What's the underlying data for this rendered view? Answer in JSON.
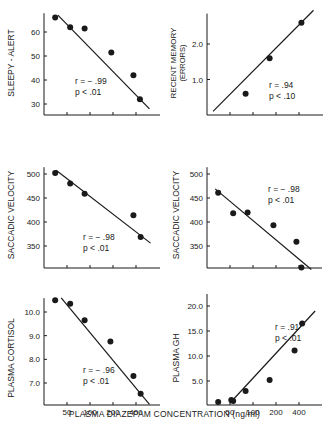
{
  "figure": {
    "shared_xlabel": "PLASMA DIAZEPAM CONCENTRATION (ng/ml)",
    "x_tick_labels": [
      "50",
      "100",
      "200",
      "400"
    ],
    "colors": {
      "ink": "#1a1a1a",
      "background": "#ffffff"
    }
  },
  "chart_data": [
    {
      "type": "scatter",
      "panel": "top-left",
      "ylabel": "SLEEPY - ALERT",
      "xlabel": "PLASMA DIAZEPAM CONCENTRATION (ng/ml)",
      "xscale": "log",
      "xticks": [
        50,
        100,
        200,
        400
      ],
      "yticks": [
        30,
        40,
        50,
        60
      ],
      "ylim": [
        24,
        67
      ],
      "points": [
        [
          35,
          66
        ],
        [
          55,
          62
        ],
        [
          85,
          61.5
        ],
        [
          190,
          51.5
        ],
        [
          370,
          42
        ],
        [
          450,
          32
        ]
      ],
      "fit_line": {
        "from": [
          38,
          67
        ],
        "to": [
          600,
          28
        ]
      },
      "annotation": [
        "r = − .99",
        "p < .01"
      ],
      "grid": false
    },
    {
      "type": "scatter",
      "panel": "top-right",
      "ylabel": "RECENT MEMORY",
      "ylabel2": "(ERRORS)",
      "xlabel": "PLASMA DIAZEPAM CONCENTRATION (ng/ml)",
      "xscale": "log",
      "xticks": [
        50,
        100,
        200,
        400
      ],
      "yticks": [
        1.0,
        2.0
      ],
      "ytick_labels": [
        "1.0",
        "2.0"
      ],
      "ylim": [
        0,
        2.8
      ],
      "points": [
        [
          80,
          0.6
        ],
        [
          165,
          1.6
        ],
        [
          430,
          2.6
        ]
      ],
      "fit_line": {
        "from": [
          30,
          0.1
        ],
        "to": [
          620,
          2.95
        ]
      },
      "annotation": [
        "r = .94",
        "p < .10"
      ],
      "grid": false
    },
    {
      "type": "scatter",
      "panel": "middle-left",
      "ylabel": "SACCADIC VELOCITY",
      "xlabel": "PLASMA DIAZEPAM CONCENTRATION (ng/ml)",
      "xscale": "log",
      "xticks": [
        50,
        100,
        200,
        400
      ],
      "yticks": [
        350,
        400,
        450,
        500
      ],
      "ylim": [
        300,
        510
      ],
      "points": [
        [
          35,
          502
        ],
        [
          55,
          480
        ],
        [
          85,
          459
        ],
        [
          370,
          414
        ],
        [
          460,
          369
        ]
      ],
      "fit_line": {
        "from": [
          36,
          508
        ],
        "to": [
          620,
          356
        ]
      },
      "annotation": [
        "r = − .98",
        "p < .01"
      ],
      "grid": false
    },
    {
      "type": "scatter",
      "panel": "middle-right",
      "ylabel": "SACCADIC VELOCITY",
      "xlabel": "PLASMA DIAZEPAM CONCENTRATION (ng/ml)",
      "xscale": "log",
      "xticks": [
        50,
        100,
        200,
        400
      ],
      "yticks": [
        350,
        400,
        450,
        500
      ],
      "ylim": [
        300,
        510
      ],
      "points": [
        [
          35,
          461
        ],
        [
          55,
          418
        ],
        [
          85,
          420
        ],
        [
          185,
          393
        ],
        [
          370,
          359
        ],
        [
          430,
          305
        ]
      ],
      "fit_line": {
        "from": [
          32,
          469
        ],
        "to": [
          580,
          301
        ]
      },
      "annotation": [
        "r = − .98",
        "p < .01"
      ],
      "grid": false
    },
    {
      "type": "scatter",
      "panel": "bottom-left",
      "ylabel": "PLASMA CORTISOL",
      "xlabel": "PLASMA DIAZEPAM CONCENTRATION (ng/ml)",
      "xscale": "log",
      "xticks": [
        50,
        100,
        200,
        400
      ],
      "xtick_labels": [
        "50",
        "100",
        "200",
        "400"
      ],
      "yticks": [
        7.0,
        8.0,
        9.0,
        10.0
      ],
      "ytick_labels": [
        "7.0",
        "8.0",
        "9.0",
        "10.0"
      ],
      "ylim": [
        6.0,
        10.5
      ],
      "points": [
        [
          35,
          10.5
        ],
        [
          55,
          10.35
        ],
        [
          85,
          9.65
        ],
        [
          185,
          8.75
        ],
        [
          370,
          7.3
        ],
        [
          460,
          6.55
        ]
      ],
      "fit_line": {
        "from": [
          42,
          10.6
        ],
        "to": [
          600,
          6.1
        ]
      },
      "annotation": [
        "r = − .96",
        "p < .01"
      ],
      "grid": false
    },
    {
      "type": "scatter",
      "panel": "bottom-right",
      "ylabel": "PLASMA GH",
      "xlabel": "PLASMA DIAZEPAM CONCENTRATION (ng/ml)",
      "xscale": "log",
      "xticks": [
        50,
        100,
        200,
        400
      ],
      "xtick_labels": [
        "50",
        "100",
        "200",
        "400"
      ],
      "yticks": [
        5.0,
        10.0,
        15.0,
        20.0
      ],
      "ytick_labels": [
        "5.0",
        "10.0",
        "15.0",
        "20.0"
      ],
      "ylim": [
        0,
        22
      ],
      "points": [
        [
          35,
          0.8
        ],
        [
          52,
          1.2
        ],
        [
          55,
          1.0
        ],
        [
          80,
          3.0
        ],
        [
          165,
          5.2
        ],
        [
          350,
          11.1
        ],
        [
          440,
          16.5
        ]
      ],
      "fit_line": {
        "from": [
          50,
          0.6
        ],
        "to": [
          650,
          19
        ]
      },
      "annotation": [
        "r = .91",
        "p < .01"
      ],
      "grid": false
    }
  ]
}
